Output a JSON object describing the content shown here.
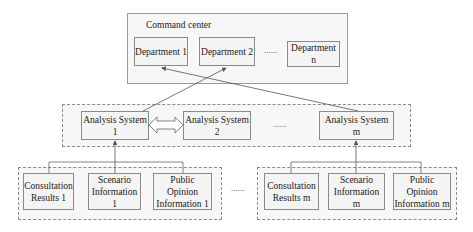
{
  "command_center": {
    "title": "Command center",
    "departments": [
      {
        "label": "Department 1"
      },
      {
        "label": "Department 2"
      },
      {
        "label": "Department n"
      }
    ],
    "ellipsis": "......"
  },
  "analysis_layer": {
    "systems": [
      {
        "label": "Analysis System 1"
      },
      {
        "label": "Analysis System 2"
      },
      {
        "label": "Analysis System m"
      }
    ],
    "ellipsis": "......"
  },
  "source_groups": [
    {
      "items": [
        {
          "label": "Consultation\nResults 1"
        },
        {
          "label": "Scenario\nInformation 1"
        },
        {
          "label": "Public Opinion\nInformation 1"
        }
      ]
    },
    {
      "items": [
        {
          "label": "Consultation\nResults m"
        },
        {
          "label": "Scenario\nInformation m"
        },
        {
          "label": "Public Opinion\nInformation m"
        }
      ]
    }
  ],
  "groups_ellipsis": "......",
  "colors": {
    "line": "#555555",
    "border": "#8a8a8a",
    "fill": "#f4f4f4"
  }
}
